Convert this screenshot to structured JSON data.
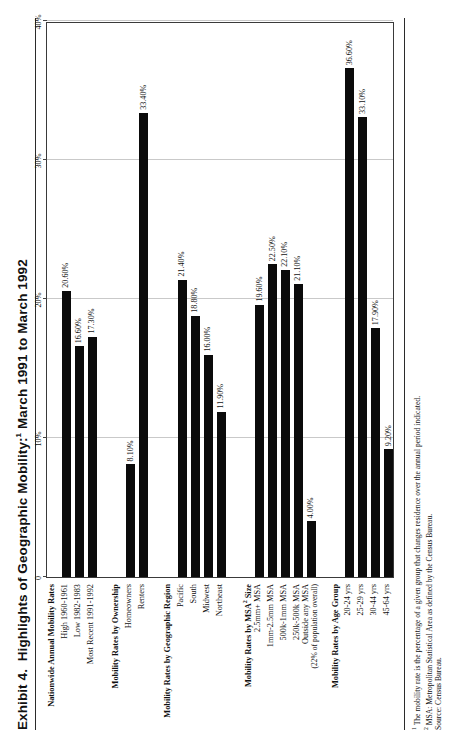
{
  "document": {
    "exhibit_label": "Exhibit 4.",
    "title": "Highlights of Geographic Mobility:",
    "title_footnote_marker": "1",
    "title_period": " March 1991 to March 1992",
    "full_title": "Exhibit 4.  Highlights of Geographic Mobility:1 March 1991 to March 1992"
  },
  "footnotes": {
    "note1_marker": "1",
    "note1": "The mobility rate is the percentage of a given group that changes residence over the annual period indicated.",
    "note2_marker": "2",
    "note2": "MSA: Metropolitan Statistical Area as defined by the Census Bureau.",
    "source": "Source: Census Bureau."
  },
  "chart_data": {
    "type": "bar",
    "orientation": "horizontal",
    "xlabel": "",
    "ylabel": "",
    "xlim": [
      0,
      40
    ],
    "xticks": [
      0,
      10,
      20,
      30,
      40
    ],
    "xtick_labels": [
      "0",
      "10%",
      "20%",
      "30%",
      "40%"
    ],
    "grid": true,
    "legend": "none",
    "value_suffix": "%",
    "rows": [
      {
        "label": "Nationwide Annual Mobility Rates",
        "type": "header",
        "value": null,
        "value_label": ""
      },
      {
        "label": "High 1960-1961",
        "type": "bar",
        "value": 20.6,
        "value_label": "20.60%"
      },
      {
        "label": "Low 1982-1983",
        "type": "bar",
        "value": 16.6,
        "value_label": "16.60%"
      },
      {
        "label": "Most Recent 1991-1992",
        "type": "bar",
        "value": 17.3,
        "value_label": "17.30%"
      },
      {
        "label": "",
        "type": "spacer",
        "value": null,
        "value_label": ""
      },
      {
        "label": "Mobility Rates by Ownership",
        "type": "header",
        "value": null,
        "value_label": ""
      },
      {
        "label": "Homeowners",
        "type": "bar",
        "value": 8.1,
        "value_label": "8.10%"
      },
      {
        "label": "Renters",
        "type": "bar",
        "value": 33.4,
        "value_label": "33.40%"
      },
      {
        "label": "",
        "type": "spacer",
        "value": null,
        "value_label": ""
      },
      {
        "label": "Mobility Rates by Geographic Region",
        "type": "header",
        "value": null,
        "value_label": ""
      },
      {
        "label": "Pacific",
        "type": "bar",
        "value": 21.4,
        "value_label": "21.40%"
      },
      {
        "label": "South",
        "type": "bar",
        "value": 18.8,
        "value_label": "18.80%"
      },
      {
        "label": "Midwest",
        "type": "bar",
        "value": 16.0,
        "value_label": "16.00%"
      },
      {
        "label": "Northeast",
        "type": "bar",
        "value": 11.9,
        "value_label": "11.90%"
      },
      {
        "label": "",
        "type": "spacer",
        "value": null,
        "value_label": ""
      },
      {
        "label": "Mobility Rates by MSA2  Size",
        "type": "header",
        "value": null,
        "value_label": ""
      },
      {
        "label": "2.5mm+ MSA",
        "type": "bar",
        "value": 19.6,
        "value_label": "19.60%"
      },
      {
        "label": "1mm-2.5mm MSA",
        "type": "bar",
        "value": 22.5,
        "value_label": "22.50%"
      },
      {
        "label": "500k-1mm MSA",
        "type": "bar",
        "value": 22.1,
        "value_label": "22.10%"
      },
      {
        "label": "250k-500k MSA",
        "type": "bar",
        "value": 21.1,
        "value_label": "21.10%"
      },
      {
        "label": "Outside any MSA",
        "sublabel": "(22% of population overall)",
        "type": "bar",
        "value": 4.0,
        "value_label": "4.00%"
      },
      {
        "label": "",
        "type": "spacer",
        "value": null,
        "value_label": ""
      },
      {
        "label": "Mobility Rates by Age Group",
        "type": "header",
        "value": null,
        "value_label": ""
      },
      {
        "label": "20-24 yrs",
        "type": "bar",
        "value": 36.6,
        "value_label": "36.60%"
      },
      {
        "label": "25-29 yrs",
        "type": "bar",
        "value": 33.1,
        "value_label": "33.10%"
      },
      {
        "label": "30-44 yrs",
        "type": "bar",
        "value": 17.9,
        "value_label": "17.90%"
      },
      {
        "label": "45-64 yrs",
        "type": "bar",
        "value": 9.2,
        "value_label": "9.20%"
      }
    ]
  }
}
